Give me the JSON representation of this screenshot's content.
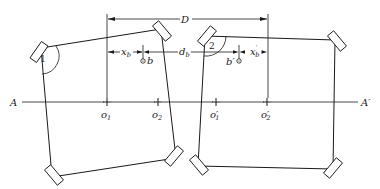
{
  "diagram": {
    "type": "engineering-schematic",
    "dimensions": {
      "D": "D",
      "xb": "x",
      "xb_sub": "b",
      "db": "d",
      "db_sub": "b",
      "xb_prime": "x",
      "xb_prime_sub": "b",
      "xb_prime_sup": "′"
    },
    "points": {
      "b": "b",
      "b_prime": "b′"
    },
    "axis": {
      "start": "A",
      "end": "A′"
    },
    "centers": [
      {
        "label": "o",
        "sub": "1"
      },
      {
        "label": "o",
        "sub": "2"
      },
      {
        "label": "o′",
        "sub": "1"
      },
      {
        "label": "o′",
        "sub": "2"
      }
    ],
    "panels": [
      {
        "id": "1",
        "label": "1"
      },
      {
        "id": "2",
        "label": "2"
      }
    ]
  }
}
